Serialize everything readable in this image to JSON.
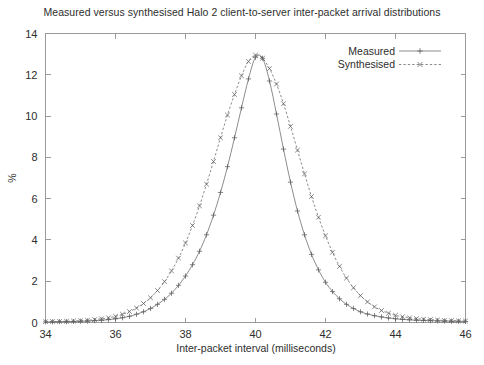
{
  "chart_data": {
    "type": "line",
    "title": "Measured versus synthesised Halo 2 client-to-server inter-packet arrival distributions",
    "xlabel": "Inter-packet interval (milliseconds)",
    "ylabel": "%",
    "xlim": [
      34,
      46
    ],
    "ylim": [
      0,
      14
    ],
    "xticks": [
      34,
      36,
      38,
      40,
      42,
      44,
      46
    ],
    "yticks": [
      0,
      2,
      4,
      6,
      8,
      10,
      12,
      14
    ],
    "grid": false,
    "legend_position": "top-right",
    "legend": [
      "Measured",
      "Synthesised"
    ],
    "x": [
      34.0,
      34.2,
      34.4,
      34.6,
      34.8,
      35.0,
      35.2,
      35.4,
      35.6,
      35.8,
      36.0,
      36.2,
      36.4,
      36.6,
      36.8,
      37.0,
      37.2,
      37.4,
      37.6,
      37.8,
      38.0,
      38.2,
      38.4,
      38.6,
      38.8,
      39.0,
      39.2,
      39.4,
      39.6,
      39.8,
      40.0,
      40.2,
      40.4,
      40.6,
      40.8,
      41.0,
      41.2,
      41.4,
      41.6,
      41.8,
      42.0,
      42.2,
      42.4,
      42.6,
      42.8,
      43.0,
      43.2,
      43.4,
      43.6,
      43.8,
      44.0,
      44.2,
      44.4,
      44.6,
      44.8,
      45.0,
      45.2,
      45.4,
      45.6,
      45.8,
      46.0
    ],
    "series": [
      {
        "name": "Measured",
        "marker": "plus",
        "linestyle": "solid",
        "values": [
          0.03,
          0.03,
          0.04,
          0.04,
          0.05,
          0.06,
          0.07,
          0.09,
          0.11,
          0.14,
          0.18,
          0.23,
          0.3,
          0.4,
          0.52,
          0.68,
          0.88,
          1.12,
          1.42,
          1.8,
          2.25,
          2.8,
          3.45,
          4.25,
          5.2,
          6.3,
          7.55,
          8.95,
          10.4,
          11.8,
          12.85,
          12.8,
          11.7,
          10.1,
          8.4,
          6.8,
          5.4,
          4.25,
          3.3,
          2.55,
          1.95,
          1.5,
          1.15,
          0.88,
          0.68,
          0.52,
          0.41,
          0.33,
          0.27,
          0.22,
          0.18,
          0.15,
          0.13,
          0.11,
          0.1,
          0.09,
          0.08,
          0.07,
          0.06,
          0.06,
          0.05
        ]
      },
      {
        "name": "Synthesised",
        "marker": "cross",
        "linestyle": "dashed",
        "values": [
          0.04,
          0.05,
          0.05,
          0.06,
          0.07,
          0.09,
          0.11,
          0.14,
          0.18,
          0.23,
          0.3,
          0.4,
          0.53,
          0.7,
          0.92,
          1.2,
          1.55,
          1.98,
          2.5,
          3.12,
          3.85,
          4.7,
          5.65,
          6.7,
          7.8,
          8.95,
          10.05,
          11.05,
          11.95,
          12.65,
          12.95,
          12.8,
          12.3,
          11.55,
          10.6,
          9.5,
          8.35,
          7.2,
          6.1,
          5.1,
          4.2,
          3.4,
          2.72,
          2.15,
          1.68,
          1.3,
          1.0,
          0.76,
          0.58,
          0.45,
          0.35,
          0.28,
          0.23,
          0.19,
          0.16,
          0.14,
          0.12,
          0.1,
          0.09,
          0.08,
          0.07
        ]
      }
    ]
  },
  "colors": {
    "background": "#ffffff",
    "frame": "#9a9a9a",
    "series_line": "#6f6f6f",
    "text": "#2e2e2e"
  }
}
